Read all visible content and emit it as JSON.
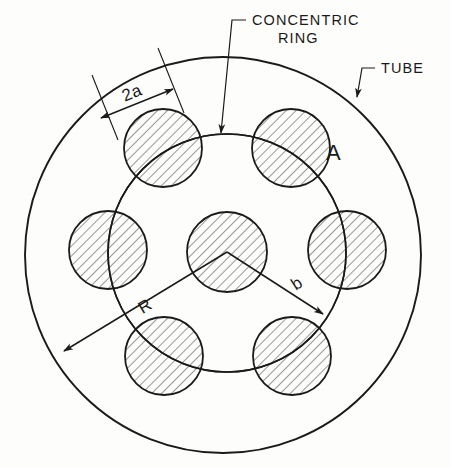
{
  "figure": {
    "type": "engineering-cross-section-diagram",
    "background_color": "#fdfdfb",
    "line_color": "#1a1a1a",
    "hatch_color": "#3a3a3a"
  },
  "callouts": [
    {
      "id": "concentric-ring",
      "line1": "CONCENTRIC",
      "line2": "RING",
      "text": "CONCENTRIC RING"
    },
    {
      "id": "tube",
      "line1": "TUBE",
      "line2": "",
      "text": "TUBE"
    }
  ],
  "dimensions": [
    {
      "id": "diameter",
      "label": "2a",
      "description": "diameter of a rod"
    },
    {
      "id": "outer-radius",
      "label": "R",
      "description": "tube radius"
    },
    {
      "id": "ring-radius",
      "label": "b",
      "description": "concentric ring radius"
    }
  ],
  "annotations": [
    {
      "id": "region-a",
      "label": "A",
      "description": "region label"
    }
  ],
  "geometry": {
    "tube": {
      "cx": 223,
      "cy": 255,
      "r": 198
    },
    "concentric_ring": {
      "cx": 227,
      "cy": 253,
      "r": 119
    },
    "center_circle": {
      "cx": 227,
      "cy": 252,
      "r": 40
    },
    "satellite_radius": 39,
    "satellite_count": 6,
    "satellites": [
      {
        "cx": 163,
        "cy": 148
      },
      {
        "cx": 291,
        "cy": 148
      },
      {
        "cx": 347,
        "cy": 250
      },
      {
        "cx": 292,
        "cy": 356
      },
      {
        "cx": 164,
        "cy": 356
      },
      {
        "cx": 108,
        "cy": 250
      }
    ]
  }
}
